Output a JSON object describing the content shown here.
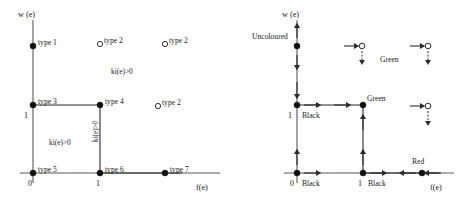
{
  "figure": {
    "caption": "",
    "panels": [
      {
        "id": "left",
        "axes": {
          "y_label": "w (e)",
          "x_label": "f(e)",
          "x_ticks": [
            "0",
            "1"
          ],
          "y_ticks": [
            "1"
          ]
        },
        "points": [
          {
            "name": "type 1",
            "label": "type 1",
            "marker": "filled",
            "x": 0,
            "y": 2.0
          },
          {
            "name": "type 2 upper left",
            "label": "type 2",
            "marker": "open",
            "x": 1.0,
            "y": 2.0
          },
          {
            "name": "type 2 upper right",
            "label": "type 2",
            "marker": "open",
            "x": 1.85,
            "y": 2.0
          },
          {
            "name": "type 3",
            "label": "type 3",
            "marker": "filled",
            "x": 0,
            "y": 1
          },
          {
            "name": "type 4",
            "label": "type 4",
            "marker": "filled",
            "x": 1,
            "y": 1
          },
          {
            "name": "type 2 middle right",
            "label": "type 2",
            "marker": "open",
            "x": 1.75,
            "y": 1
          },
          {
            "name": "type 5",
            "label": "type 5",
            "marker": "filled",
            "x": 0,
            "y": 0
          },
          {
            "name": "type 6",
            "label": "type 6",
            "marker": "filled",
            "x": 1,
            "y": 0
          },
          {
            "name": "type 7",
            "label": "type 7",
            "marker": "filled",
            "x": 1.85,
            "y": 0
          }
        ],
        "annotations": [
          {
            "name": "upper-region-condition",
            "text": "ki(e)>0",
            "orientation": "horizontal"
          },
          {
            "name": "inner-region-condition",
            "text": "ki(e)>0",
            "orientation": "horizontal"
          },
          {
            "name": "vertical-edge-condition",
            "text": "ki(e)>0",
            "orientation": "vertical"
          }
        ]
      },
      {
        "id": "right",
        "axes": {
          "y_label": "w (e)",
          "x_label": "f(e)",
          "x_ticks": [
            "0",
            "1"
          ],
          "y_ticks": [
            "1"
          ]
        },
        "points": [
          {
            "name": "uncoloured-point",
            "label": "Uncoloured",
            "marker": "filled",
            "x": 0,
            "y": 2.0
          },
          {
            "name": "open-point-upper-left",
            "label": "",
            "marker": "open",
            "x": 1.0,
            "y": 2.0
          },
          {
            "name": "open-point-upper-right",
            "label": "Green",
            "marker": "open",
            "x": 1.85,
            "y": 2.0
          },
          {
            "name": "black-point-y1",
            "label": "Black",
            "marker": "filled",
            "x": 0,
            "y": 1
          },
          {
            "name": "green-corner-point",
            "label": "Green",
            "marker": "filled",
            "x": 1,
            "y": 1
          },
          {
            "name": "open-point-middle-right",
            "label": "",
            "marker": "open",
            "x": 1.75,
            "y": 1
          },
          {
            "name": "black-origin-point",
            "label": "Black",
            "marker": "filled",
            "x": 0,
            "y": 0
          },
          {
            "name": "black-point-x1",
            "label": "Black",
            "marker": "filled",
            "x": 1,
            "y": 0
          },
          {
            "name": "red-point",
            "label": "Red",
            "marker": "filled",
            "x": 1.85,
            "y": 0
          }
        ],
        "labels": {
          "uncoloured": "Uncoloured",
          "green_corner": "Green",
          "green_upper": "Green",
          "red": "Red",
          "black_y1": "Black",
          "black_origin": "Black",
          "black_x1": "Black"
        }
      }
    ]
  },
  "colors": {
    "axis": "#5a5a5a",
    "line": "#2b2b2b",
    "dotted": "#9a9a9a",
    "text": "#1a1a1a",
    "marker_fill": "#111111",
    "background": "#ffffff"
  }
}
